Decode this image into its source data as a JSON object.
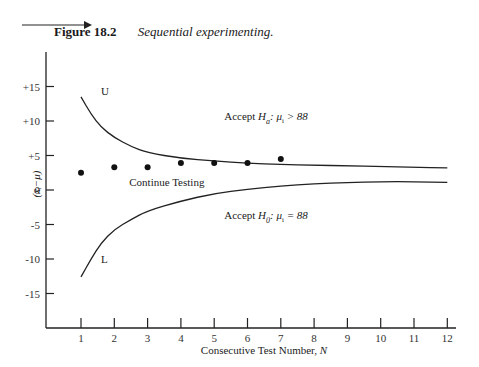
{
  "figure": {
    "number": "Figure 18.2",
    "title": "Sequential experimenting."
  },
  "chart_data": {
    "type": "line",
    "title": "Sequential experimenting.",
    "xlabel": "Consecutive Test Number, N",
    "xlabel_text": "Consecutive Test Number, ",
    "xlabel_var": "N",
    "ylabel": "(x̄ᵢ−μ)",
    "xlim": [
      0,
      12.4
    ],
    "ylim": [
      -20,
      20
    ],
    "x_ticks": [
      1,
      2,
      3,
      4,
      5,
      6,
      7,
      8,
      9,
      10,
      11,
      12
    ],
    "y_ticks": [
      {
        "value": 15,
        "label": "+15"
      },
      {
        "value": 10,
        "label": "+10"
      },
      {
        "value": 5,
        "label": "+5"
      },
      {
        "value": 0,
        "label": "0"
      },
      {
        "value": -5,
        "label": "-5"
      },
      {
        "value": -10,
        "label": "-10"
      },
      {
        "value": -15,
        "label": "-15"
      }
    ],
    "grid": false,
    "series": [
      {
        "name": "U",
        "kind": "line",
        "x": [
          1,
          1.3,
          1.6,
          2.0,
          2.5,
          3.0,
          4.0,
          5.0,
          6.0,
          7.0,
          8.0,
          9.0,
          10.0,
          11.0,
          12.0
        ],
        "values": [
          13.5,
          11.0,
          9.1,
          7.6,
          6.3,
          5.4,
          4.6,
          4.2,
          3.9,
          3.7,
          3.6,
          3.5,
          3.4,
          3.3,
          3.2
        ]
      },
      {
        "name": "L",
        "kind": "line",
        "x": [
          1,
          1.3,
          1.6,
          2.0,
          2.5,
          3.0,
          4.0,
          5.0,
          6.0,
          7.0,
          8.0,
          9.0,
          10.0,
          11.0,
          12.0
        ],
        "values": [
          -12.6,
          -10.0,
          -7.7,
          -5.7,
          -4.3,
          -3.0,
          -1.6,
          -0.5,
          0.1,
          0.6,
          0.9,
          1.1,
          1.2,
          1.2,
          1.1
        ]
      },
      {
        "name": "Test results",
        "kind": "scatter",
        "x": [
          1,
          2,
          3,
          4,
          5,
          6,
          7
        ],
        "values": [
          2.5,
          3.3,
          3.3,
          3.9,
          3.9,
          3.9,
          4.5
        ]
      }
    ],
    "annotations": [
      {
        "id": "U",
        "text": "U",
        "x": 1.6,
        "y": 13.8
      },
      {
        "id": "L",
        "text": "L",
        "x": 1.6,
        "y": -10.6
      },
      {
        "id": "continue",
        "text": "Continue Testing",
        "x": 2.45,
        "y": 0.6
      },
      {
        "id": "accept_ha",
        "prefix": "Accept ",
        "H": "H",
        "sub": "a",
        "rest": ": μ",
        "rest_sub": "i",
        "tail": " > 88",
        "x": 5.3,
        "y": 10.2
      },
      {
        "id": "accept_h0",
        "prefix": "Accept ",
        "H": "H",
        "sub": "0",
        "rest": ": μ",
        "rest_sub": "i",
        "tail": " = 88",
        "x": 5.3,
        "y": -4.2
      }
    ]
  }
}
